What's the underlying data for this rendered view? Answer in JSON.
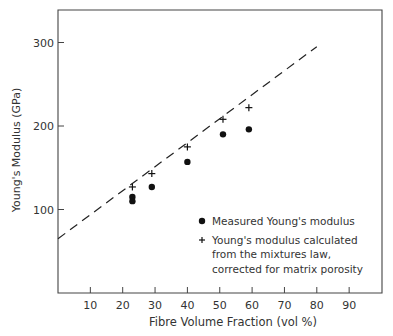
{
  "chart_data": {
    "type": "scatter",
    "title": "",
    "xlabel": "Fibre Volume Fraction (vol %)",
    "ylabel": "Young's Modulus (GPa)",
    "xlim": [
      0,
      100
    ],
    "ylim": [
      0,
      340
    ],
    "x_ticks": [
      10,
      20,
      30,
      40,
      50,
      60,
      70,
      80,
      90
    ],
    "x_tick_labels": [
      "10",
      "20",
      "30",
      "40",
      "50",
      "60",
      "70",
      "80",
      "90"
    ],
    "y_ticks": [
      100,
      200,
      300
    ],
    "y_tick_labels": [
      "100",
      "200",
      "300"
    ],
    "grid": false,
    "legend_position": "lower right (inside)",
    "series": [
      {
        "name": "Measured Young's modulus",
        "marker": "filled-circle",
        "points": [
          [
            23,
            115
          ],
          [
            23,
            110
          ],
          [
            29,
            127
          ],
          [
            40,
            157
          ],
          [
            51,
            190
          ],
          [
            59,
            196
          ]
        ]
      },
      {
        "name": "Young's modulus calculated from the mixtures law, corrected for matrix porosity",
        "marker": "plus",
        "points": [
          [
            23,
            127
          ],
          [
            29,
            143
          ],
          [
            40,
            175
          ],
          [
            51,
            208
          ],
          [
            59,
            222
          ]
        ]
      },
      {
        "name": "Rule of mixtures (dashed line)",
        "style": "dashed-line",
        "points": [
          [
            0,
            65
          ],
          [
            80,
            295
          ]
        ]
      }
    ]
  },
  "legend": {
    "measured": "Measured Young's modulus",
    "calc_line1": "Young's modulus calculated",
    "calc_line2": "from the mixtures law,",
    "calc_line3": "corrected for matrix porosity"
  },
  "axes": {
    "xlabel": "Fibre Volume Fraction (vol %)",
    "ylabel": "Young's Modulus (GPa)"
  }
}
